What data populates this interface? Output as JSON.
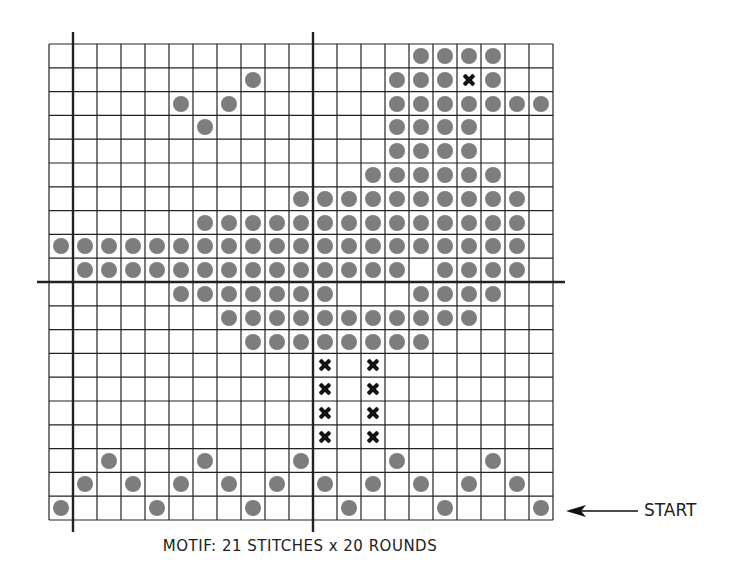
{
  "chart_data": {
    "type": "table",
    "title": "MOTIF: 21 STITCHES x 20 ROUNDS",
    "columns": 21,
    "rows": 20,
    "legend": {
      "dot": "filled circle (gray) — contrast stitch",
      "x": "cross mark (black)"
    },
    "axis_lines": {
      "vertical_after_columns": [
        0,
        10
      ],
      "horizontal_after_rows_from_top": [
        9
      ]
    },
    "annotation": "START",
    "annotation_row_from_top": 19,
    "grid_rows_top_to_bottom": [
      {
        "dots": [
          15,
          16,
          17,
          18
        ],
        "x": []
      },
      {
        "dots": [
          8,
          14,
          15,
          16,
          18
        ],
        "x": [
          17
        ]
      },
      {
        "dots": [
          5,
          7,
          14,
          15,
          16,
          17,
          18,
          19,
          20
        ],
        "x": []
      },
      {
        "dots": [
          6,
          14,
          15,
          16,
          17
        ],
        "x": []
      },
      {
        "dots": [
          14,
          15,
          16,
          17
        ],
        "x": []
      },
      {
        "dots": [
          13,
          14,
          15,
          16,
          17,
          18
        ],
        "x": []
      },
      {
        "dots": [
          10,
          11,
          12,
          13,
          14,
          15,
          16,
          17,
          18,
          19
        ],
        "x": []
      },
      {
        "dots": [
          6,
          7,
          8,
          9,
          10,
          11,
          12,
          13,
          14,
          15,
          16,
          17,
          18,
          19
        ],
        "x": []
      },
      {
        "dots": [
          0,
          1,
          2,
          3,
          4,
          5,
          6,
          7,
          8,
          9,
          10,
          11,
          12,
          13,
          14,
          15,
          16,
          17,
          18,
          19
        ],
        "x": []
      },
      {
        "dots": [
          1,
          2,
          3,
          4,
          5,
          6,
          7,
          8,
          9,
          10,
          11,
          12,
          13,
          14,
          16,
          17,
          18,
          19
        ],
        "x": []
      },
      {
        "dots": [
          5,
          6,
          7,
          8,
          9,
          10,
          11,
          15,
          16,
          17,
          18
        ],
        "x": []
      },
      {
        "dots": [
          7,
          8,
          9,
          10,
          11,
          12,
          13,
          14,
          15,
          16,
          17
        ],
        "x": []
      },
      {
        "dots": [
          8,
          9,
          10,
          11,
          12,
          13,
          14,
          15
        ],
        "x": []
      },
      {
        "dots": [],
        "x": [
          11,
          13
        ]
      },
      {
        "dots": [],
        "x": [
          11,
          13
        ]
      },
      {
        "dots": [],
        "x": [
          11,
          13
        ]
      },
      {
        "dots": [],
        "x": [
          11,
          13
        ]
      },
      {
        "dots": [
          2,
          6,
          10,
          14,
          18
        ],
        "x": []
      },
      {
        "dots": [
          1,
          3,
          5,
          7,
          9,
          11,
          13,
          15,
          17,
          19
        ],
        "x": []
      },
      {
        "dots": [
          0,
          4,
          8,
          12,
          16,
          20
        ],
        "x": []
      }
    ]
  },
  "caption": "MOTIF: 21 STITCHES x 20 ROUNDS",
  "start_label": "START",
  "colors": {
    "dot": "#7d7d7d",
    "x": "#111111",
    "grid": "#222222"
  }
}
